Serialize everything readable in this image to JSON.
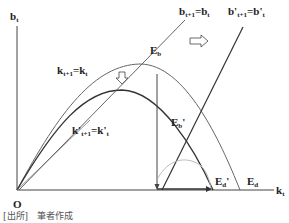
{
  "labels": {
    "y_axis": "b",
    "y_axis_sub": "t",
    "x_axis": "k",
    "x_axis_sub": "t",
    "origin": "O",
    "k_curve_main": "k",
    "k_curve_sub1": "t+1",
    "k_curve_eq": "=k",
    "k_curve_sub2": "t",
    "k_prime_curve_main": "k'",
    "k_prime_curve_sub1": "t+1",
    "k_prime_curve_eq": "=k'",
    "k_prime_curve_sub2": "t",
    "b_line_main": "b",
    "b_line_sub1": "t+1",
    "b_line_eq": "=b",
    "b_line_sub2": "t",
    "b_prime_line_main": "b'",
    "b_prime_line_sub1": "t+1",
    "b_prime_line_eq": "=b'",
    "b_prime_line_sub2": "t",
    "E_b": "E",
    "E_b_sub": "b",
    "E_b_prime": "E",
    "E_b_prime_sub": "b",
    "E_b_prime_mark": "'",
    "E_d": "E",
    "E_d_sub": "d",
    "E_d_prime": "E",
    "E_d_prime_sub": "d",
    "E_d_prime_mark": "'"
  },
  "source": "[出所]　筆者作成",
  "colors": {
    "line": "#333333",
    "light_line": "#666666",
    "gray_arc": "#bbbbbb"
  }
}
